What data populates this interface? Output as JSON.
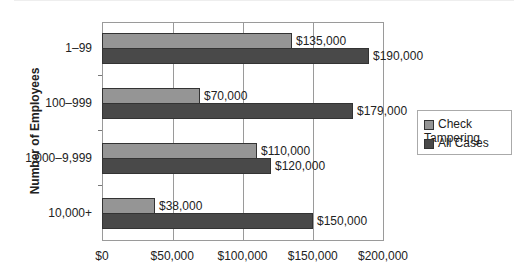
{
  "chart_data": {
    "type": "bar",
    "orientation": "horizontal",
    "title": "",
    "xlabel": "",
    "ylabel": "Number of Employees",
    "categories": [
      "1–99",
      "100–999",
      "1,000–9,999",
      "10,000+"
    ],
    "series": [
      {
        "name": "Check Tampering",
        "color": "#959595",
        "values": [
          135000,
          70000,
          110000,
          38000
        ],
        "labels": [
          "$135,000",
          "$70,000",
          "$110,000",
          "$38,000"
        ]
      },
      {
        "name": "All Cases",
        "color": "#494949",
        "values": [
          190000,
          179000,
          120000,
          150000
        ],
        "labels": [
          "$190,000",
          "$179,000",
          "$120,000",
          "$150,000"
        ]
      }
    ],
    "xlim": [
      0,
      200000
    ],
    "xticks": [
      "$0",
      "$50,000",
      "$100,000",
      "$150,000",
      "$200,000"
    ],
    "grid": "vertical",
    "legend_position": "right"
  },
  "legend": {
    "items": [
      "Check Tampering",
      "All Cases"
    ]
  },
  "axis": {
    "ylabel": "Number of Employees"
  }
}
